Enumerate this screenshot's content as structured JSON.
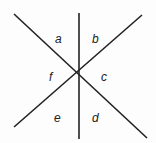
{
  "diagram": {
    "colors": {
      "line": "#222222",
      "label": "#222222",
      "background": "#fdfdfd"
    },
    "center": {
      "x": 78,
      "y": 75
    },
    "lines": [
      {
        "id": "vertical",
        "x1": 79,
        "y1": 13,
        "x2": 79,
        "y2": 139
      },
      {
        "id": "diagonal-down",
        "x1": 14,
        "y1": 14,
        "x2": 147,
        "y2": 138
      },
      {
        "id": "diagonal-up",
        "x1": 142,
        "y1": 15,
        "x2": 14,
        "y2": 127
      }
    ],
    "angles": [
      {
        "label": "a",
        "x": 55,
        "y": 43
      },
      {
        "label": "b",
        "x": 92,
        "y": 43
      },
      {
        "label": "c",
        "x": 101,
        "y": 81
      },
      {
        "label": "d",
        "x": 92,
        "y": 122
      },
      {
        "label": "e",
        "x": 54,
        "y": 122
      },
      {
        "label": "f",
        "x": 49,
        "y": 81
      }
    ]
  }
}
